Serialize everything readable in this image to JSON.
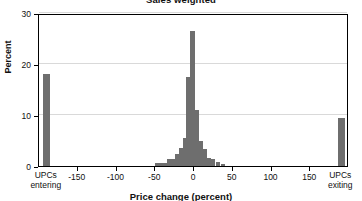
{
  "chart_data": {
    "type": "bar",
    "title": "Sales weighted",
    "xlabel": "Price change (percent)",
    "ylabel": "Percent",
    "xlim": [
      -200,
      200
    ],
    "ylim": [
      0,
      30
    ],
    "grid": true,
    "legend": null,
    "y_ticks": [
      0,
      10,
      20,
      30
    ],
    "y_tick_labels": [
      "0",
      "10",
      "20",
      "30"
    ],
    "x_ticks": [
      -150,
      -100,
      -50,
      0,
      50,
      100,
      150
    ],
    "x_tick_labels": [
      "-150",
      "-100",
      "-50",
      "0",
      "50",
      "100",
      "150"
    ],
    "special_x_labels": [
      {
        "position": -190,
        "line1": "UPCs",
        "line2": "entering"
      },
      {
        "position": 190,
        "line1": "UPCs",
        "line2": "exiting"
      }
    ],
    "bar_color": "#6e6e6e",
    "gridline_color": "#d9d9d9",
    "axis_color": "#000000",
    "background_color": "#ffffff",
    "bars": [
      {
        "x": -190,
        "value": 18.0,
        "label": "UPCs entering"
      },
      {
        "x": -47,
        "value": 0.5,
        "label": "-47"
      },
      {
        "x": -42,
        "value": 0.6,
        "label": "-42"
      },
      {
        "x": -37,
        "value": 0.5,
        "label": "-37"
      },
      {
        "x": -32,
        "value": 1.3,
        "label": "-32"
      },
      {
        "x": -27,
        "value": 1.4,
        "label": "-27"
      },
      {
        "x": -22,
        "value": 2.3,
        "label": "-22"
      },
      {
        "x": -17,
        "value": 3.6,
        "label": "-17"
      },
      {
        "x": -12,
        "value": 5.4,
        "label": "-12"
      },
      {
        "x": -7,
        "value": 17.5,
        "label": "-7"
      },
      {
        "x": -2,
        "value": 26.5,
        "label": "-2"
      },
      {
        "x": 4,
        "value": 11.0,
        "label": "4"
      },
      {
        "x": 9,
        "value": 5.0,
        "label": "9"
      },
      {
        "x": 14,
        "value": 3.3,
        "label": "14"
      },
      {
        "x": 19,
        "value": 1.5,
        "label": "19"
      },
      {
        "x": 24,
        "value": 1.4,
        "label": "24"
      },
      {
        "x": 31,
        "value": 0.7,
        "label": "31"
      },
      {
        "x": 37,
        "value": 0.3,
        "label": "37"
      },
      {
        "x": 190,
        "value": 9.5,
        "label": "UPCs exiting"
      }
    ]
  }
}
